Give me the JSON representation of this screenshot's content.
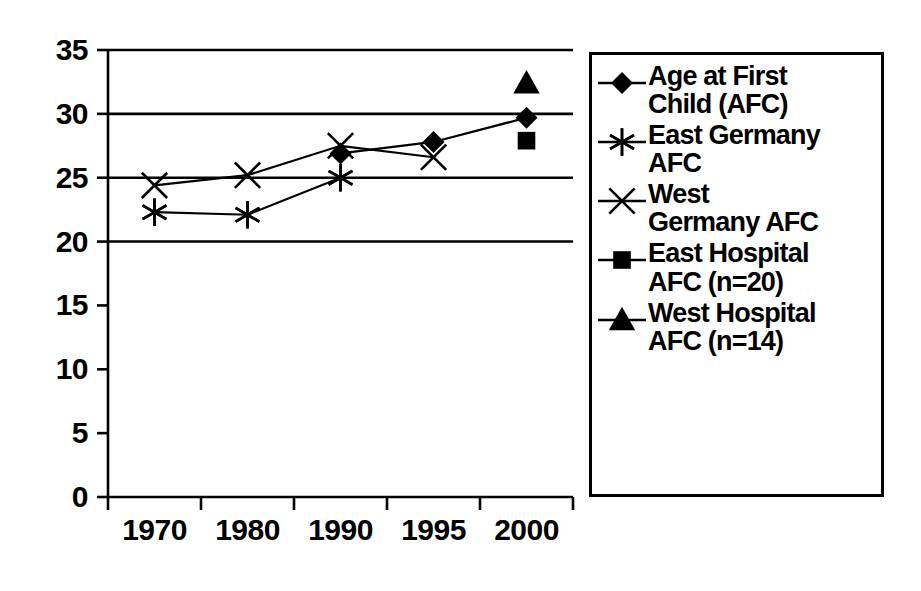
{
  "chart_data": {
    "type": "line",
    "title": "",
    "xlabel": "",
    "ylabel": "",
    "categories": [
      "1970",
      "1980",
      "1990",
      "1995",
      "2000"
    ],
    "ylim": [
      0,
      35
    ],
    "yticks": [
      0,
      5,
      10,
      15,
      20,
      25,
      30,
      35
    ],
    "ytick_labels": [
      "0",
      "5",
      "10",
      "15",
      "20",
      "25",
      "30",
      "35"
    ],
    "grid": "horizontal",
    "legend_position": "right",
    "series": [
      {
        "name": "Age at First Child (AFC)",
        "marker": "diamond",
        "line": true,
        "values": [
          null,
          null,
          26.9,
          27.8,
          29.7
        ]
      },
      {
        "name": "East Germany AFC",
        "marker": "asterisk",
        "line": true,
        "values": [
          22.3,
          22.1,
          25.0,
          null,
          null
        ]
      },
      {
        "name": "West Germany AFC",
        "marker": "cross",
        "line": true,
        "values": [
          24.4,
          25.2,
          27.5,
          26.6,
          null
        ]
      },
      {
        "name": "East Hospital AFC (n=20)",
        "marker": "square",
        "line": false,
        "values": [
          null,
          null,
          null,
          null,
          27.9
        ]
      },
      {
        "name": "West Hospital AFC (n=14)",
        "marker": "triangle",
        "line": false,
        "values": [
          null,
          null,
          null,
          null,
          32.4
        ]
      }
    ]
  },
  "legend": {
    "items": [
      {
        "marker": "diamond-marker-icon",
        "label": "Age at First\nChild (AFC)"
      },
      {
        "marker": "asterisk-marker-icon",
        "label": "East Germany\nAFC"
      },
      {
        "marker": "cross-marker-icon",
        "label": "West\nGermany AFC"
      },
      {
        "marker": "square-marker-icon",
        "label": "East Hospital\nAFC (n=20)"
      },
      {
        "marker": "triangle-marker-icon",
        "label": "West Hospital\nAFC (n=14)"
      }
    ]
  },
  "colors": {
    "foreground": "#000000",
    "background": "#ffffff",
    "grid": "#000000"
  }
}
